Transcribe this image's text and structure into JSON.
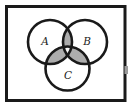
{
  "diagram": {
    "type": "venn",
    "sets": [
      {
        "label": "A",
        "position": "top-left"
      },
      {
        "label": "B",
        "position": "top-right"
      },
      {
        "label": "C",
        "position": "bottom-center"
      }
    ],
    "shaded_regions": [
      "A∩B only",
      "A∩C only",
      "B∩C only"
    ],
    "unshaded_regions": [
      "A∩B∩C",
      "A only",
      "B only",
      "C only",
      "outside circles"
    ],
    "colors": {
      "stroke": "#1a1a1a",
      "shade": "#adadad",
      "center_fill": "#fafafa",
      "background": "#ffffff",
      "artifact": "#9a9a9a"
    }
  }
}
